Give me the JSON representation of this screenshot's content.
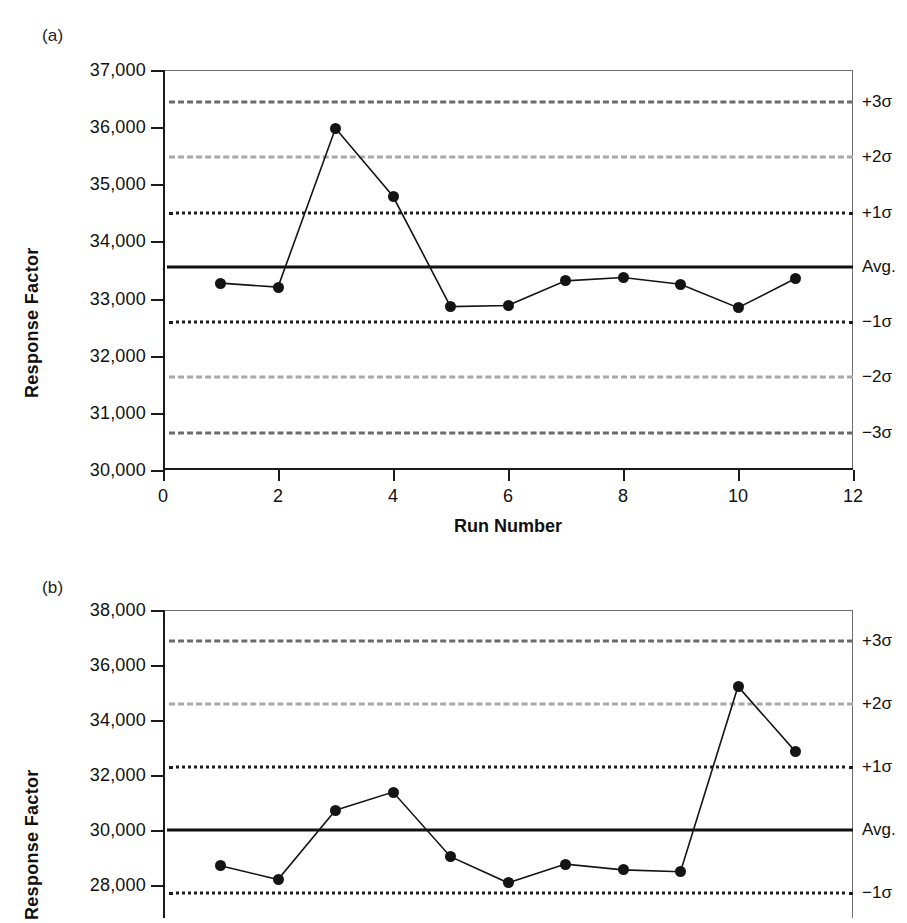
{
  "panels": [
    {
      "label": "(a)",
      "ylabel": "Response Factor",
      "xlabel": "Run Number"
    },
    {
      "label": "(b)",
      "ylabel": "Response Factor",
      "xlabel": ""
    }
  ],
  "limit_labels": {
    "p3": "+3σ",
    "p2": "+2σ",
    "p1": "+1σ",
    "avg": "Avg.",
    "m1": "−1σ",
    "m2": "−2σ",
    "m3": "−3σ"
  },
  "colors": {
    "sigma3": "#6b6b6b",
    "sigma2": "#a8a8a8",
    "sigma1": "#1d1d1d",
    "average": "#111111",
    "marker": "#141414",
    "axis": "#1a1a1a"
  },
  "chart_data": [
    {
      "type": "line",
      "title": "(a)",
      "xlabel": "Run Number",
      "ylabel": "Response Factor",
      "xlim": [
        0,
        12
      ],
      "ylim": [
        30000,
        37000
      ],
      "xticks": [
        0,
        2,
        4,
        6,
        8,
        10,
        12
      ],
      "xticklabels": [
        "0",
        "2",
        "4",
        "6",
        "8",
        "10",
        "12"
      ],
      "yticks": [
        30000,
        31000,
        32000,
        33000,
        34000,
        35000,
        36000,
        37000
      ],
      "yticklabels": [
        "30,000",
        "31,000",
        "32,000",
        "33,000",
        "34,000",
        "35,000",
        "36,000",
        "37,000"
      ],
      "grid": false,
      "legend": "right-edge-labels",
      "x": [
        1,
        2,
        3,
        4,
        5,
        6,
        7,
        8,
        9,
        10,
        11
      ],
      "values": [
        33270,
        33200,
        35980,
        34790,
        32860,
        32880,
        33310,
        33370,
        33250,
        32840,
        33350
      ],
      "control_lines": [
        {
          "name": "+3σ",
          "value": 36440,
          "style": "dash-dot",
          "color": "#6b6b6b"
        },
        {
          "name": "+2σ",
          "value": 35470,
          "style": "dashed",
          "color": "#a8a8a8"
        },
        {
          "name": "+1σ",
          "value": 34500,
          "style": "dotted",
          "color": "#1d1d1d"
        },
        {
          "name": "Avg.",
          "value": 33550,
          "style": "solid",
          "color": "#111111"
        },
        {
          "name": "−1σ",
          "value": 32590,
          "style": "dotted",
          "color": "#1d1d1d"
        },
        {
          "name": "−2σ",
          "value": 31620,
          "style": "dashed",
          "color": "#a8a8a8"
        },
        {
          "name": "−3σ",
          "value": 30650,
          "style": "dash-dot",
          "color": "#6b6b6b"
        }
      ]
    },
    {
      "type": "line",
      "title": "(b)",
      "xlabel": "",
      "ylabel": "Response Factor",
      "xlim": [
        0,
        12
      ],
      "ylim": [
        26800,
        38000
      ],
      "xticks": [],
      "xticklabels": [],
      "yticks": [
        28000,
        30000,
        32000,
        34000,
        36000,
        38000
      ],
      "yticklabels": [
        "28,000",
        "30,000",
        "32,000",
        "34,000",
        "36,000",
        "38,000"
      ],
      "grid": false,
      "legend": "right-edge-labels",
      "cropped_bottom": true,
      "x": [
        1,
        2,
        3,
        4,
        5,
        6,
        7,
        8,
        9,
        10,
        11
      ],
      "values": [
        28700,
        28200,
        30720,
        31380,
        29030,
        28080,
        28760,
        28550,
        28480,
        35220,
        32850
      ],
      "control_lines": [
        {
          "name": "+3σ",
          "value": 36860,
          "style": "dash-dot",
          "color": "#6b6b6b"
        },
        {
          "name": "+2σ",
          "value": 34580,
          "style": "dashed",
          "color": "#a8a8a8"
        },
        {
          "name": "+1σ",
          "value": 32280,
          "style": "dotted",
          "color": "#1d1d1d"
        },
        {
          "name": "Avg.",
          "value": 30000,
          "style": "solid",
          "color": "#111111"
        },
        {
          "name": "−1σ",
          "value": 27710,
          "style": "dotted",
          "color": "#1d1d1d"
        }
      ]
    }
  ]
}
